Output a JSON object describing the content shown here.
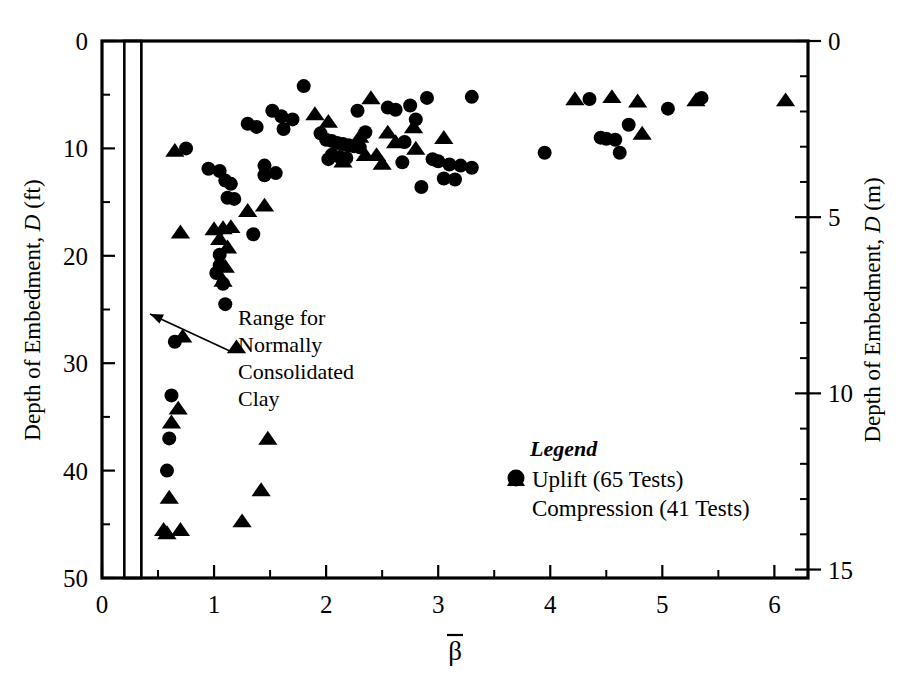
{
  "figure": {
    "background_color": "#ffffff",
    "marker_color": "#000000",
    "axis_color": "#000000"
  },
  "axes": {
    "left": {
      "title_main": "Depth of Embedment,",
      "title_var": "D",
      "title_unit": "(ft)",
      "ticks": [
        "0",
        "10",
        "20",
        "30",
        "40",
        "50"
      ],
      "min": 0,
      "max": 50,
      "minor_step": 5
    },
    "right": {
      "title_main": "Depth of Embedment,",
      "title_var": "D",
      "title_unit": "(m)",
      "ticks": [
        "0",
        "5",
        "10",
        "15"
      ],
      "min": 0,
      "max": 15.24,
      "minor_step": 1
    },
    "bottom": {
      "title": "β",
      "title_overbar": true,
      "ticks": [
        "0",
        "1",
        "2",
        "3",
        "4",
        "5",
        "6"
      ],
      "min": 0,
      "max": 6.3,
      "minor_step": 0.5
    }
  },
  "annotation": {
    "lines": [
      "Range for",
      "Normally",
      "Consolidated",
      "Clay"
    ],
    "target_label": "range-for-normally-consolidated-clay-band",
    "band_beta_min": 0.2,
    "band_beta_max": 0.35
  },
  "legend": {
    "title": "Legend",
    "entries": [
      {
        "marker": "circle",
        "label": "Uplift (65 Tests)"
      },
      {
        "marker": "triangle",
        "label": "Compression (41 Tests)"
      }
    ]
  },
  "chart_data": {
    "type": "scatter",
    "title": "",
    "xlabel": "β (beta-bar)",
    "ylabel": "Depth of Embedment, D (ft)",
    "ylabel_secondary": "Depth of Embedment, D (m)",
    "xlim": [
      0,
      6.3
    ],
    "ylim": [
      0,
      50
    ],
    "ylim_secondary": [
      0,
      15.24
    ],
    "y_inverted": true,
    "grid": false,
    "legend_position": "lower-right-inside",
    "annotations": [
      {
        "text": "Range for Normally Consolidated Clay",
        "x_range": [
          0.2,
          0.35
        ],
        "arrow_from": [
          1.25,
          32.5
        ],
        "arrow_to": [
          0.33,
          29.0
        ]
      }
    ],
    "shaded_bands": [
      {
        "label": "Range for Normally Consolidated Clay",
        "x_min": 0.2,
        "x_max": 0.35,
        "style": "diagonal-hatch"
      }
    ],
    "series": [
      {
        "name": "Uplift (65 Tests)",
        "marker": "circle",
        "color": "#000000",
        "count_label": 65,
        "points": [
          [
            0.75,
            10.0
          ],
          [
            0.95,
            11.9
          ],
          [
            1.05,
            12.1
          ],
          [
            1.1,
            13.0
          ],
          [
            1.15,
            13.3
          ],
          [
            1.12,
            14.6
          ],
          [
            1.18,
            14.7
          ],
          [
            1.05,
            19.9
          ],
          [
            1.05,
            20.9
          ],
          [
            1.02,
            21.6
          ],
          [
            1.08,
            22.6
          ],
          [
            1.1,
            24.5
          ],
          [
            0.65,
            28.0
          ],
          [
            0.62,
            33.0
          ],
          [
            0.6,
            37.0
          ],
          [
            0.58,
            40.0
          ],
          [
            1.35,
            18.0
          ],
          [
            1.45,
            12.5
          ],
          [
            1.55,
            12.3
          ],
          [
            1.45,
            11.6
          ],
          [
            1.52,
            6.5
          ],
          [
            1.6,
            7.0
          ],
          [
            1.7,
            7.3
          ],
          [
            1.62,
            8.2
          ],
          [
            1.38,
            8.0
          ],
          [
            1.3,
            7.7
          ],
          [
            1.8,
            4.2
          ],
          [
            1.95,
            8.6
          ],
          [
            2.0,
            9.2
          ],
          [
            2.05,
            9.3
          ],
          [
            2.1,
            9.5
          ],
          [
            2.15,
            9.6
          ],
          [
            2.2,
            9.7
          ],
          [
            2.25,
            9.8
          ],
          [
            2.3,
            9.9
          ],
          [
            2.05,
            10.6
          ],
          [
            2.12,
            10.8
          ],
          [
            2.18,
            10.9
          ],
          [
            2.02,
            11.0
          ],
          [
            2.28,
            6.5
          ],
          [
            2.35,
            8.5
          ],
          [
            2.55,
            6.2
          ],
          [
            2.62,
            6.4
          ],
          [
            2.75,
            6.0
          ],
          [
            2.8,
            7.3
          ],
          [
            2.7,
            9.4
          ],
          [
            2.9,
            5.3
          ],
          [
            2.68,
            11.3
          ],
          [
            2.95,
            11.0
          ],
          [
            3.0,
            11.2
          ],
          [
            3.1,
            11.5
          ],
          [
            3.2,
            11.6
          ],
          [
            3.3,
            11.8
          ],
          [
            2.85,
            13.6
          ],
          [
            3.3,
            5.2
          ],
          [
            3.05,
            12.8
          ],
          [
            3.15,
            12.9
          ],
          [
            3.95,
            10.4
          ],
          [
            4.35,
            5.4
          ],
          [
            4.45,
            9.0
          ],
          [
            4.5,
            9.1
          ],
          [
            4.58,
            9.2
          ],
          [
            4.7,
            7.8
          ],
          [
            4.62,
            10.4
          ],
          [
            5.05,
            6.3
          ],
          [
            5.35,
            5.3
          ]
        ]
      },
      {
        "name": "Compression (41 Tests)",
        "marker": "triangle",
        "color": "#000000",
        "count_label": 41,
        "points": [
          [
            0.65,
            10.2
          ],
          [
            0.7,
            17.8
          ],
          [
            0.72,
            27.5
          ],
          [
            0.68,
            34.2
          ],
          [
            0.62,
            35.5
          ],
          [
            0.6,
            42.5
          ],
          [
            0.55,
            45.5
          ],
          [
            0.58,
            45.8
          ],
          [
            0.7,
            45.5
          ],
          [
            1.0,
            17.5
          ],
          [
            1.08,
            17.4
          ],
          [
            1.15,
            17.3
          ],
          [
            1.05,
            18.4
          ],
          [
            1.12,
            19.2
          ],
          [
            1.1,
            21.0
          ],
          [
            1.08,
            22.3
          ],
          [
            1.2,
            28.5
          ],
          [
            1.3,
            15.8
          ],
          [
            1.45,
            15.3
          ],
          [
            1.48,
            37.0
          ],
          [
            1.42,
            41.8
          ],
          [
            1.25,
            44.7
          ],
          [
            2.02,
            7.5
          ],
          [
            2.3,
            8.9
          ],
          [
            2.35,
            10.6
          ],
          [
            2.45,
            10.6
          ],
          [
            2.4,
            5.3
          ],
          [
            2.55,
            8.5
          ],
          [
            2.62,
            9.4
          ],
          [
            2.78,
            8.0
          ],
          [
            2.8,
            10.0
          ],
          [
            3.05,
            9.0
          ],
          [
            4.22,
            5.4
          ],
          [
            4.55,
            5.2
          ],
          [
            4.78,
            5.6
          ],
          [
            4.82,
            8.6
          ],
          [
            5.3,
            5.5
          ],
          [
            6.1,
            5.5
          ],
          [
            1.9,
            6.8
          ],
          [
            2.15,
            11.2
          ],
          [
            2.5,
            11.4
          ]
        ]
      }
    ]
  }
}
